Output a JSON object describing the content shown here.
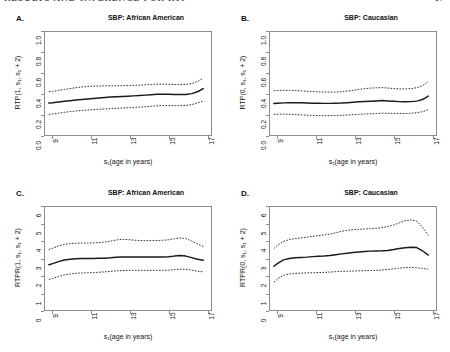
{
  "header": {
    "running_title": "RESULTS AND INFERENCE FOR RTP",
    "page_number": "17"
  },
  "figure": {
    "panels": [
      {
        "letter": "A.",
        "title": "SBP: African American",
        "ylabel": "RTP(1, s₁, s₁ + 2)",
        "xlabel": "s₁(age in years)",
        "yticks": [
          "0.0",
          "0.2",
          "0.4",
          "0.6",
          "0.8",
          "1.0"
        ],
        "xticks": [
          "9",
          "11",
          "13",
          "15",
          "17"
        ]
      },
      {
        "letter": "B.",
        "title": "SBP: Caucasian",
        "ylabel": "RTP(0, s₁, s₁ + 2)",
        "xlabel": "s₁(age in years)",
        "yticks": [
          "0.0",
          "0.2",
          "0.4",
          "0.6",
          "0.8",
          "1.0"
        ],
        "xticks": [
          "9",
          "11",
          "13",
          "15",
          "17"
        ]
      },
      {
        "letter": "C.",
        "title": "SBP: African American",
        "ylabel": "RTPR(1, s₁, s₁ + 2)",
        "xlabel": "s₁(age in years)",
        "yticks": [
          "0",
          "1",
          "2",
          "3",
          "4",
          "5",
          "6"
        ],
        "xticks": [
          "9",
          "11",
          "13",
          "15",
          "17"
        ]
      },
      {
        "letter": "D.",
        "title": "SBP: Caucasian",
        "ylabel": "RTPR(0, s₁, s₁ + 2)",
        "xlabel": "s₁(age in years)",
        "yticks": [
          "0",
          "1",
          "2",
          "3",
          "4",
          "5",
          "6"
        ],
        "xticks": [
          "9",
          "11",
          "13",
          "15",
          "17"
        ]
      }
    ]
  },
  "chart_data": [
    {
      "panel": "A",
      "type": "line",
      "title": "SBP: African American",
      "xlabel": "s1(age in years)",
      "ylabel": "RTP(1, s1, s1 + 2)",
      "xlim": [
        8.6,
        17.2
      ],
      "ylim": [
        0.0,
        1.0
      ],
      "grid": false,
      "legend": "none",
      "x": [
        8.8,
        9.0,
        9.3,
        9.6,
        9.9,
        10.2,
        10.5,
        10.8,
        11.1,
        11.4,
        11.7,
        12.0,
        12.3,
        12.6,
        12.9,
        13.2,
        13.5,
        13.8,
        14.1,
        14.4,
        14.7,
        15.0,
        15.3,
        15.6,
        15.9,
        16.2,
        16.5,
        16.8
      ],
      "series": [
        {
          "name": "estimate",
          "style": "solid",
          "values": [
            0.31,
            0.313,
            0.32,
            0.327,
            0.333,
            0.339,
            0.345,
            0.35,
            0.355,
            0.36,
            0.364,
            0.368,
            0.371,
            0.374,
            0.377,
            0.38,
            0.383,
            0.387,
            0.391,
            0.395,
            0.397,
            0.396,
            0.394,
            0.393,
            0.394,
            0.402,
            0.42,
            0.45
          ]
        },
        {
          "name": "upper-confidence-band",
          "style": "dashed",
          "values": [
            0.42,
            0.424,
            0.432,
            0.442,
            0.451,
            0.459,
            0.466,
            0.471,
            0.474,
            0.476,
            0.477,
            0.478,
            0.478,
            0.479,
            0.48,
            0.482,
            0.484,
            0.487,
            0.49,
            0.493,
            0.494,
            0.492,
            0.49,
            0.489,
            0.491,
            0.5,
            0.52,
            0.552
          ]
        },
        {
          "name": "lower-confidence-band",
          "style": "dashed",
          "values": [
            0.2,
            0.204,
            0.212,
            0.22,
            0.227,
            0.233,
            0.238,
            0.242,
            0.246,
            0.25,
            0.253,
            0.256,
            0.259,
            0.262,
            0.265,
            0.268,
            0.271,
            0.275,
            0.279,
            0.283,
            0.286,
            0.286,
            0.285,
            0.285,
            0.287,
            0.295,
            0.31,
            0.333
          ]
        }
      ]
    },
    {
      "panel": "B",
      "type": "line",
      "title": "SBP: Caucasian",
      "xlabel": "s1(age in years)",
      "ylabel": "RTP(0, s1, s1 + 2)",
      "xlim": [
        8.6,
        17.2
      ],
      "ylim": [
        0.0,
        1.0
      ],
      "grid": false,
      "legend": "none",
      "x": [
        8.8,
        9.0,
        9.3,
        9.6,
        9.9,
        10.2,
        10.5,
        10.8,
        11.1,
        11.4,
        11.7,
        12.0,
        12.3,
        12.6,
        12.9,
        13.2,
        13.5,
        13.8,
        14.1,
        14.4,
        14.7,
        15.0,
        15.3,
        15.6,
        15.9,
        16.2,
        16.5,
        16.8
      ],
      "series": [
        {
          "name": "estimate",
          "style": "solid",
          "values": [
            0.305,
            0.308,
            0.312,
            0.314,
            0.314,
            0.313,
            0.311,
            0.309,
            0.308,
            0.307,
            0.307,
            0.308,
            0.31,
            0.314,
            0.318,
            0.322,
            0.325,
            0.328,
            0.331,
            0.334,
            0.331,
            0.327,
            0.324,
            0.323,
            0.324,
            0.329,
            0.344,
            0.378
          ]
        },
        {
          "name": "upper-confidence-band",
          "style": "dashed",
          "values": [
            0.43,
            0.432,
            0.434,
            0.434,
            0.432,
            0.429,
            0.425,
            0.422,
            0.419,
            0.417,
            0.416,
            0.417,
            0.42,
            0.426,
            0.434,
            0.443,
            0.45,
            0.455,
            0.458,
            0.46,
            0.456,
            0.451,
            0.448,
            0.447,
            0.45,
            0.459,
            0.478,
            0.52
          ]
        },
        {
          "name": "lower-confidence-band",
          "style": "dashed",
          "values": [
            0.2,
            0.202,
            0.203,
            0.202,
            0.199,
            0.196,
            0.193,
            0.191,
            0.189,
            0.188,
            0.188,
            0.189,
            0.191,
            0.194,
            0.197,
            0.2,
            0.203,
            0.206,
            0.209,
            0.212,
            0.211,
            0.21,
            0.209,
            0.209,
            0.211,
            0.216,
            0.226,
            0.245
          ]
        }
      ]
    },
    {
      "panel": "C",
      "type": "line",
      "title": "SBP: African American",
      "xlabel": "s1(age in years)",
      "ylabel": "RTPR(1, s1, s1 + 2)",
      "xlim": [
        8.6,
        17.2
      ],
      "ylim": [
        0,
        6
      ],
      "grid": false,
      "legend": "none",
      "x": [
        8.8,
        9.0,
        9.3,
        9.6,
        9.9,
        10.2,
        10.5,
        10.8,
        11.1,
        11.4,
        11.7,
        12.0,
        12.3,
        12.6,
        12.9,
        13.2,
        13.5,
        13.8,
        14.1,
        14.4,
        14.7,
        15.0,
        15.3,
        15.6,
        15.9,
        16.2,
        16.5,
        16.8
      ],
      "series": [
        {
          "name": "estimate",
          "style": "solid",
          "values": [
            2.64,
            2.7,
            2.82,
            2.91,
            2.96,
            2.99,
            3.0,
            3.0,
            3.0,
            3.01,
            3.02,
            3.04,
            3.07,
            3.09,
            3.09,
            3.09,
            3.09,
            3.09,
            3.09,
            3.09,
            3.09,
            3.1,
            3.14,
            3.17,
            3.14,
            3.05,
            2.96,
            2.9
          ]
        },
        {
          "name": "upper-confidence-band",
          "style": "dashed",
          "values": [
            3.52,
            3.6,
            3.73,
            3.82,
            3.87,
            3.89,
            3.9,
            3.9,
            3.91,
            3.93,
            3.96,
            4.01,
            4.08,
            4.12,
            4.1,
            4.07,
            4.05,
            4.04,
            4.04,
            4.05,
            4.06,
            4.09,
            4.15,
            4.2,
            4.16,
            4.02,
            3.85,
            3.7
          ]
        },
        {
          "name": "lower-confidence-band",
          "style": "dashed",
          "values": [
            1.78,
            1.84,
            1.95,
            2.04,
            2.1,
            2.14,
            2.16,
            2.17,
            2.18,
            2.2,
            2.22,
            2.25,
            2.28,
            2.3,
            2.31,
            2.31,
            2.31,
            2.31,
            2.31,
            2.31,
            2.31,
            2.32,
            2.35,
            2.38,
            2.37,
            2.32,
            2.26,
            2.22
          ]
        }
      ]
    },
    {
      "panel": "D",
      "type": "line",
      "title": "SBP: Caucasian",
      "xlabel": "s1(age in years)",
      "ylabel": "RTPR(0, s1, s1 + 2)",
      "xlim": [
        8.6,
        17.2
      ],
      "ylim": [
        0,
        6
      ],
      "grid": false,
      "legend": "none",
      "x": [
        8.8,
        9.0,
        9.3,
        9.6,
        9.9,
        10.2,
        10.5,
        10.8,
        11.1,
        11.4,
        11.7,
        12.0,
        12.3,
        12.6,
        12.9,
        13.2,
        13.5,
        13.8,
        14.1,
        14.4,
        14.7,
        15.0,
        15.3,
        15.6,
        15.9,
        16.2,
        16.5,
        16.8
      ],
      "series": [
        {
          "name": "estimate",
          "style": "solid",
          "values": [
            2.55,
            2.72,
            2.92,
            3.0,
            3.04,
            3.06,
            3.08,
            3.11,
            3.13,
            3.14,
            3.17,
            3.22,
            3.27,
            3.31,
            3.35,
            3.38,
            3.41,
            3.43,
            3.44,
            3.45,
            3.47,
            3.52,
            3.58,
            3.63,
            3.65,
            3.64,
            3.45,
            3.2
          ]
        },
        {
          "name": "upper-confidence-band",
          "style": "dashed",
          "values": [
            3.58,
            3.78,
            4.0,
            4.1,
            4.16,
            4.2,
            4.24,
            4.29,
            4.33,
            4.37,
            4.42,
            4.5,
            4.58,
            4.64,
            4.68,
            4.7,
            4.72,
            4.74,
            4.76,
            4.8,
            4.86,
            4.95,
            5.08,
            5.2,
            5.25,
            5.18,
            4.82,
            4.35
          ]
        },
        {
          "name": "lower-confidence-band",
          "style": "dashed",
          "values": [
            1.62,
            1.82,
            2.02,
            2.1,
            2.13,
            2.15,
            2.16,
            2.17,
            2.18,
            2.19,
            2.21,
            2.23,
            2.25,
            2.26,
            2.27,
            2.28,
            2.29,
            2.3,
            2.31,
            2.33,
            2.36,
            2.4,
            2.44,
            2.47,
            2.48,
            2.46,
            2.42,
            2.38
          ]
        }
      ]
    }
  ]
}
